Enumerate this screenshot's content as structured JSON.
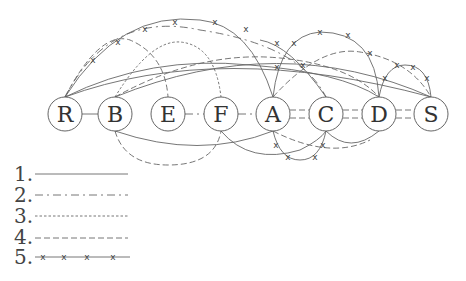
{
  "diagram": {
    "nodes": [
      {
        "id": "R",
        "label": "R",
        "x": 65,
        "y": 114
      },
      {
        "id": "B",
        "label": "B",
        "x": 115,
        "y": 114
      },
      {
        "id": "E",
        "label": "E",
        "x": 168,
        "y": 114
      },
      {
        "id": "F",
        "label": "F",
        "x": 221,
        "y": 114
      },
      {
        "id": "A",
        "label": "A",
        "x": 273,
        "y": 114
      },
      {
        "id": "C",
        "label": "C",
        "x": 326,
        "y": 114
      },
      {
        "id": "D",
        "label": "D",
        "x": 379,
        "y": 114
      },
      {
        "id": "S",
        "label": "S",
        "x": 431,
        "y": 114
      }
    ],
    "edges": [
      {
        "from": "R",
        "to": "B",
        "style": 1
      },
      {
        "from": "E",
        "to": "F",
        "style": 2
      },
      {
        "from": "F",
        "to": "A",
        "style": 2
      },
      {
        "from": "A",
        "to": "C",
        "style": 2
      },
      {
        "from": "C",
        "to": "D",
        "style": 2
      },
      {
        "from": "D",
        "to": "S",
        "style": 2
      },
      {
        "from": "R",
        "to": "A",
        "style": 5
      },
      {
        "from": "R",
        "to": "C",
        "style": 2
      },
      {
        "from": "R",
        "to": "S",
        "style": 1
      },
      {
        "from": "R",
        "to": "D",
        "style": 1
      },
      {
        "from": "R",
        "to": "E",
        "style": 4
      },
      {
        "from": "B",
        "to": "F",
        "style": 3
      },
      {
        "from": "B",
        "to": "D",
        "style": 4
      },
      {
        "from": "B",
        "to": "S",
        "style": 1
      },
      {
        "from": "A",
        "to": "D",
        "style": 5
      },
      {
        "from": "D",
        "to": "S",
        "style": 5
      },
      {
        "from": "A",
        "to": "S",
        "style": 4
      },
      {
        "from": "C",
        "to": "S",
        "style": 2
      },
      {
        "from": "A",
        "to": "C",
        "style": 5
      },
      {
        "from": "B",
        "to": "F",
        "style": 4
      },
      {
        "from": "F",
        "to": "C",
        "style": 1
      },
      {
        "from": "B",
        "to": "A",
        "style": 1
      },
      {
        "from": "C",
        "to": "D",
        "style": 1
      },
      {
        "from": "C",
        "to": "D",
        "style": 4
      }
    ]
  },
  "legend": {
    "items": [
      {
        "number": "1.",
        "style": "solid"
      },
      {
        "number": "2.",
        "style": "dash-dot"
      },
      {
        "number": "3.",
        "style": "dotted"
      },
      {
        "number": "4.",
        "style": "dashed"
      },
      {
        "number": "5.",
        "style": "crossed"
      }
    ]
  }
}
